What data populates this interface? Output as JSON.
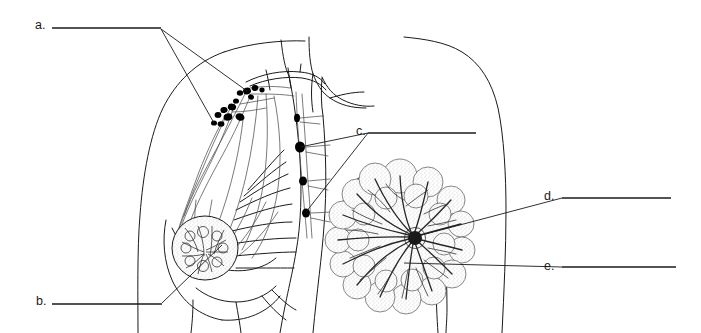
{
  "document": {
    "type": "anatomy-labeling-worksheet",
    "title": "Breast and Axillary Lymphatic Drainage",
    "background_color": "#ffffff",
    "ink_color": "#1a1a1a",
    "width": 701,
    "height": 333
  },
  "labels": [
    {
      "id": "a",
      "text": "a.",
      "text_x": 35,
      "text_y": 29,
      "line_x1": 52,
      "line_y1": 28,
      "line_x2": 161,
      "line_y2": 28,
      "answer": "",
      "leaders": [
        {
          "points": "161,29 247,91"
        },
        {
          "points": "161,29 214,123"
        }
      ]
    },
    {
      "id": "b",
      "text": "b.",
      "text_x": 36,
      "text_y": 305,
      "line_x1": 52,
      "line_y1": 304,
      "line_x2": 162,
      "line_y2": 304,
      "answer": "",
      "leaders": [
        {
          "points": "162,303 222,245"
        }
      ]
    },
    {
      "id": "c",
      "text": "c.",
      "text_x": 356,
      "text_y": 135,
      "line_x1": 368,
      "line_y1": 133,
      "line_x2": 476,
      "line_y2": 133,
      "answer": "",
      "leaders": [
        {
          "points": "368,133 300,147"
        },
        {
          "points": "368,133 306,212"
        }
      ]
    },
    {
      "id": "d",
      "text": "d.",
      "text_x": 544,
      "text_y": 200,
      "line_x1": 562,
      "line_y1": 198,
      "line_x2": 671,
      "line_y2": 198,
      "answer": "",
      "leaders": [
        {
          "points": "562,198 418,236"
        }
      ]
    },
    {
      "id": "e",
      "text": "e.",
      "text_x": 544,
      "text_y": 270,
      "line_x1": 562,
      "line_y1": 267,
      "line_x2": 676,
      "line_y2": 267,
      "answer": "",
      "leaders": [
        {
          "points": "562,267 404,263"
        }
      ]
    }
  ],
  "figures": {
    "lateral_view": {
      "name": "lateral-torso-lymphatic-view",
      "description": "Side view of chest wall showing lymphatic vessels, axillary node cluster and internal mammary node chain"
    },
    "frontal_view": {
      "name": "frontal-breast-cutaway",
      "description": "Front cut-away of breast showing lobules and lactiferous ducts converging at the nipple"
    }
  },
  "lymph_nodes": {
    "axillary_cluster": [
      {
        "cx": 247,
        "cy": 91,
        "rx": 4.0,
        "ry": 3.4,
        "rot": -20
      },
      {
        "cx": 255,
        "cy": 88,
        "rx": 3.4,
        "ry": 3.0,
        "rot": 10
      },
      {
        "cx": 240,
        "cy": 93,
        "rx": 3.2,
        "ry": 2.8,
        "rot": 0
      },
      {
        "cx": 251,
        "cy": 97,
        "rx": 3.0,
        "ry": 2.6,
        "rot": 30
      },
      {
        "cx": 262,
        "cy": 90,
        "rx": 2.6,
        "ry": 2.4,
        "rot": 0
      },
      {
        "cx": 224,
        "cy": 110,
        "rx": 3.6,
        "ry": 3.0,
        "rot": -15
      },
      {
        "cx": 232,
        "cy": 107,
        "rx": 4.2,
        "ry": 3.4,
        "rot": 15
      },
      {
        "cx": 218,
        "cy": 115,
        "rx": 3.4,
        "ry": 3.0,
        "rot": 0
      },
      {
        "cx": 228,
        "cy": 117,
        "rx": 4.4,
        "ry": 3.6,
        "rot": -10
      },
      {
        "cx": 240,
        "cy": 117,
        "rx": 4.6,
        "ry": 3.6,
        "rot": 20
      },
      {
        "cx": 221,
        "cy": 124,
        "rx": 3.4,
        "ry": 2.8,
        "rot": 0
      },
      {
        "cx": 214,
        "cy": 123,
        "rx": 3.0,
        "ry": 2.6,
        "rot": 0
      },
      {
        "cx": 236,
        "cy": 101,
        "rx": 3.0,
        "ry": 2.6,
        "rot": 0
      }
    ],
    "internal_mammary_chain": [
      {
        "cx": 297,
        "cy": 118,
        "rx": 3.0,
        "ry": 4.2,
        "rot": 0
      },
      {
        "cx": 300,
        "cy": 147,
        "rx": 5.0,
        "ry": 5.6,
        "rot": 0
      },
      {
        "cx": 303,
        "cy": 181,
        "rx": 4.0,
        "ry": 4.6,
        "rot": 0
      },
      {
        "cx": 306,
        "cy": 213,
        "rx": 4.0,
        "ry": 4.6,
        "rot": 0
      }
    ]
  }
}
